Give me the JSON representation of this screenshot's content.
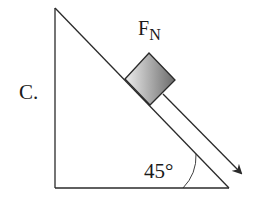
{
  "diagram": {
    "option_label": "C.",
    "force_label_main": "F",
    "force_label_sub": "N",
    "angle_label": "45°",
    "colors": {
      "line": "#2a2a2a",
      "block_light": "#e6e6e6",
      "block_dark": "#6e6e6e",
      "background": "#ffffff"
    }
  }
}
